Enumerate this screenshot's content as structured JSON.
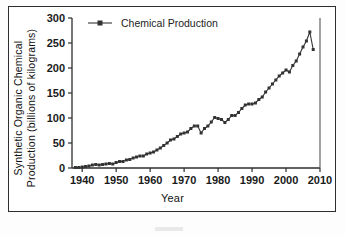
{
  "figure": {
    "background_color": "#ffffff",
    "frame_color": "#2e2e2e",
    "series_color": "#333333"
  },
  "chart_data": {
    "type": "line",
    "title": "",
    "xlabel": "Year",
    "ylabel": "Synthetic Organic Chemical Production (billions of kilograms)",
    "ylabel_line1": "Synthetic Organic  Chemical",
    "ylabel_line2": "Production (billions of kilograms)",
    "xlim": [
      1937,
      2010
    ],
    "ylim": [
      0,
      300
    ],
    "xticks": [
      1940,
      1950,
      1960,
      1970,
      1980,
      1990,
      2000,
      2010
    ],
    "xtick_labels": [
      "1940",
      "1950",
      "1960",
      "1970",
      "1980",
      "1990",
      "2000",
      "2010"
    ],
    "yticks": [
      0,
      50,
      100,
      150,
      200,
      250,
      300
    ],
    "ytick_labels": [
      "0",
      "50",
      "100",
      "150",
      "200",
      "250",
      "300"
    ],
    "grid": false,
    "legend_position": "top-left",
    "marker": "square",
    "series": [
      {
        "name": "Chemical Production",
        "x": [
          1938,
          1939,
          1940,
          1941,
          1942,
          1943,
          1944,
          1945,
          1946,
          1947,
          1948,
          1949,
          1950,
          1951,
          1952,
          1953,
          1954,
          1955,
          1956,
          1957,
          1958,
          1959,
          1960,
          1961,
          1962,
          1963,
          1964,
          1965,
          1966,
          1967,
          1968,
          1969,
          1970,
          1971,
          1972,
          1973,
          1974,
          1975,
          1976,
          1977,
          1978,
          1979,
          1980,
          1981,
          1982,
          1983,
          1984,
          1985,
          1986,
          1987,
          1988,
          1989,
          1990,
          1991,
          1992,
          1993,
          1994,
          1995,
          1996,
          1997,
          1998,
          1999,
          2000,
          2001,
          2002,
          2003,
          2004,
          2005,
          2006,
          2007,
          2008
        ],
        "values": [
          1,
          1,
          2,
          3,
          4,
          6,
          7,
          6,
          7,
          8,
          9,
          8,
          11,
          13,
          13,
          16,
          17,
          20,
          22,
          24,
          24,
          28,
          30,
          32,
          36,
          40,
          45,
          50,
          56,
          58,
          63,
          68,
          70,
          72,
          79,
          84,
          84,
          70,
          79,
          84,
          92,
          101,
          99,
          97,
          91,
          97,
          105,
          105,
          111,
          119,
          126,
          128,
          128,
          130,
          137,
          142,
          152,
          160,
          168,
          176,
          184,
          190,
          196,
          192,
          205,
          214,
          228,
          242,
          254,
          272,
          237
        ],
        "units": "billions of kilograms"
      }
    ]
  },
  "legend": {
    "entries": [
      {
        "label": "Chemical Production"
      }
    ]
  },
  "axes": {
    "x_title": "Year",
    "y_title_line1": "Synthetic Organic  Chemical",
    "y_title_line2": "Production (billions of kilograms)"
  }
}
